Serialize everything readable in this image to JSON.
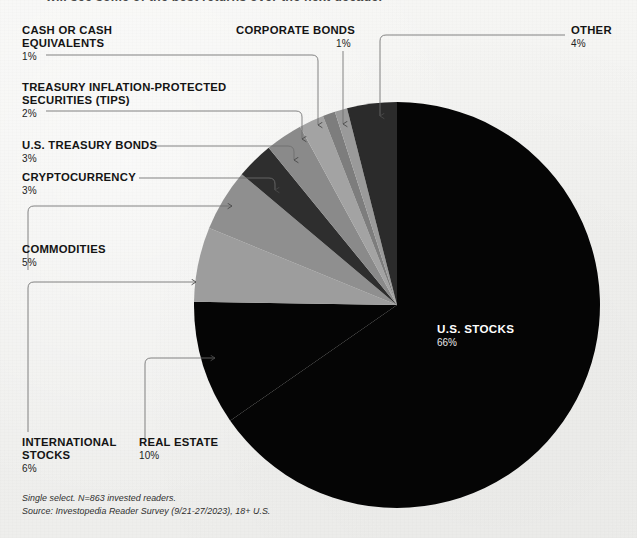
{
  "headline": {
    "text": "will see some of the best returns over the next decade."
  },
  "chart_data": {
    "type": "pie",
    "legend_position": "callouts",
    "labels": [
      "U.S. STOCKS",
      "OTHER",
      "CORPORATE BONDS",
      "CASH OR CASH\nEQUIVALENTS",
      "TREASURY INFLATION-PROTECTED\nSECURITIES (TIPS)",
      "U.S. TREASURY BONDS",
      "CRYPTOCURRENCY",
      "COMMODITIES",
      "INTERNATIONAL\nSTOCKS",
      "REAL ESTATE"
    ],
    "values": [
      66,
      4,
      1,
      1,
      2,
      3,
      3,
      5,
      6,
      10
    ],
    "value_labels": [
      "66%",
      "4%",
      "1%",
      "1%",
      "2%",
      "3%",
      "3%",
      "5%",
      "6%",
      "10%"
    ],
    "colors": [
      "#050505",
      "#2b2b2b",
      "#9a9a9a",
      "#7d7d7d",
      "#a3a3a3",
      "#8a8a8a",
      "#2e2e2e",
      "#8f8f8f",
      "#9d9d9d",
      "#050505"
    ],
    "total": 100,
    "units": "percent"
  },
  "slices": [
    {
      "id": "us-stocks",
      "label": "U.S. STOCKS",
      "pct": "66%",
      "value": 66,
      "color": "#050505"
    },
    {
      "id": "other",
      "label": "OTHER",
      "pct": "4%",
      "value": 4,
      "color": "#2b2b2b"
    },
    {
      "id": "corporate-bonds",
      "label": "CORPORATE BONDS",
      "pct": "1%",
      "value": 1,
      "color": "#9a9a9a"
    },
    {
      "id": "cash",
      "label": "CASH OR CASH\nEQUIVALENTS",
      "pct": "1%",
      "value": 1,
      "color": "#7d7d7d"
    },
    {
      "id": "tips",
      "label": "TREASURY INFLATION-PROTECTED\nSECURITIES (TIPS)",
      "pct": "2%",
      "value": 2,
      "color": "#a3a3a3"
    },
    {
      "id": "treasury-bonds",
      "label": "U.S. TREASURY BONDS",
      "pct": "3%",
      "value": 3,
      "color": "#8a8a8a"
    },
    {
      "id": "cryptocurrency",
      "label": "CRYPTOCURRENCY",
      "pct": "3%",
      "value": 3,
      "color": "#2e2e2e"
    },
    {
      "id": "commodities",
      "label": "COMMODITIES",
      "pct": "5%",
      "value": 5,
      "color": "#8f8f8f"
    },
    {
      "id": "international",
      "label": "INTERNATIONAL\nSTOCKS",
      "pct": "6%",
      "value": 6,
      "color": "#9d9d9d"
    },
    {
      "id": "real-estate",
      "label": "REAL ESTATE",
      "pct": "10%",
      "value": 10,
      "color": "#050505"
    }
  ],
  "footnote": {
    "line1": "Single select. N=863 invested readers.",
    "line2": "Source: Investopedia Reader Survey (9/21-27/2023), 18+ U.S."
  }
}
